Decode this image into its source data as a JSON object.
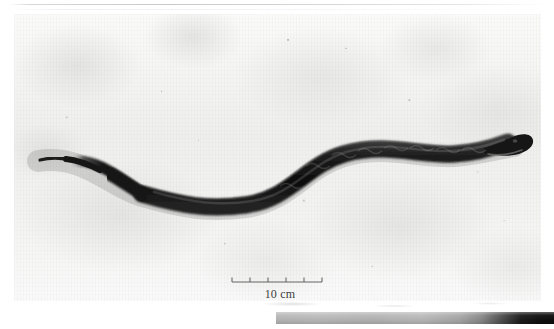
{
  "figure": {
    "kind": "grayscale-photograph",
    "caption_text": "10 cm"
  },
  "scale_bar": {
    "label": "10 cm",
    "length_value": 10,
    "length_unit": "cm",
    "tick_count": 6,
    "tick_labels": [
      "",
      "",
      "",
      "",
      "",
      ""
    ],
    "bar_color": "#555555"
  },
  "photo": {
    "background_color": "#f2f2f1",
    "snake_color": "#1a1a1a",
    "snake_highlight_color": "#565656",
    "border_color": "#e2e2e2"
  },
  "bottom_bar": {
    "label": "",
    "start_color": "#b9b9b9",
    "end_color": "#0d0d0d"
  },
  "icons": {
    "scale_bar_icon": "ruler-icon",
    "specimen_icon": "snake-icon"
  }
}
